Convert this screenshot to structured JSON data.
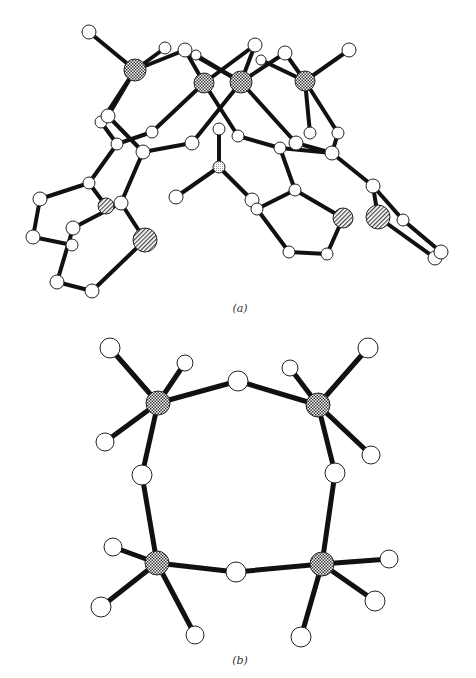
{
  "figure": {
    "width": 476,
    "height": 678,
    "colors": {
      "bond": "#111111",
      "atom_fill": "#ffffff",
      "atom_stroke": "#222222",
      "metal_fill": "#8a8a8a",
      "hetero_fill": "#d8d8d8",
      "caption": "#333333"
    },
    "panels": [
      {
        "id": "a",
        "caption": "(a)",
        "caption_pos": [
          240,
          312
        ],
        "description": "Side view of tetranuclear metal complex with organic ligands",
        "atoms": [
          {
            "id": "a1",
            "x": 89,
            "y": 32,
            "r": 7,
            "type": "light"
          },
          {
            "id": "m1",
            "x": 135,
            "y": 70,
            "r": 11,
            "type": "metal"
          },
          {
            "id": "a2",
            "x": 165,
            "y": 48,
            "r": 6,
            "type": "light"
          },
          {
            "id": "a3",
            "x": 185,
            "y": 50,
            "r": 7,
            "type": "light"
          },
          {
            "id": "a4",
            "x": 196,
            "y": 55,
            "r": 5,
            "type": "light"
          },
          {
            "id": "m2",
            "x": 204,
            "y": 83,
            "r": 10,
            "type": "metal"
          },
          {
            "id": "m3",
            "x": 241,
            "y": 82,
            "r": 11,
            "type": "metal"
          },
          {
            "id": "a5",
            "x": 255,
            "y": 45,
            "r": 7,
            "type": "light"
          },
          {
            "id": "a6",
            "x": 261,
            "y": 60,
            "r": 5,
            "type": "light"
          },
          {
            "id": "a7",
            "x": 285,
            "y": 53,
            "r": 7,
            "type": "light"
          },
          {
            "id": "m4",
            "x": 305,
            "y": 81,
            "r": 10,
            "type": "metal"
          },
          {
            "id": "a8",
            "x": 349,
            "y": 50,
            "r": 7,
            "type": "light"
          },
          {
            "id": "a9",
            "x": 101,
            "y": 122,
            "r": 6,
            "type": "light"
          },
          {
            "id": "a10",
            "x": 108,
            "y": 116,
            "r": 7,
            "type": "light"
          },
          {
            "id": "a11",
            "x": 117,
            "y": 144,
            "r": 6,
            "type": "light"
          },
          {
            "id": "a12",
            "x": 152,
            "y": 132,
            "r": 6,
            "type": "light"
          },
          {
            "id": "a13",
            "x": 143,
            "y": 152,
            "r": 7,
            "type": "light"
          },
          {
            "id": "a14",
            "x": 192,
            "y": 143,
            "r": 7,
            "type": "light"
          },
          {
            "id": "a15",
            "x": 219,
            "y": 129,
            "r": 6,
            "type": "light"
          },
          {
            "id": "a16",
            "x": 238,
            "y": 136,
            "r": 6,
            "type": "light"
          },
          {
            "id": "a17",
            "x": 280,
            "y": 148,
            "r": 6,
            "type": "light"
          },
          {
            "id": "a18",
            "x": 296,
            "y": 143,
            "r": 7,
            "type": "light"
          },
          {
            "id": "a19",
            "x": 310,
            "y": 133,
            "r": 6,
            "type": "light"
          },
          {
            "id": "a20",
            "x": 338,
            "y": 133,
            "r": 6,
            "type": "light"
          },
          {
            "id": "a21",
            "x": 332,
            "y": 153,
            "r": 7,
            "type": "light"
          },
          {
            "id": "a22",
            "x": 219,
            "y": 167,
            "r": 6,
            "type": "hetero"
          },
          {
            "id": "a23",
            "x": 176,
            "y": 197,
            "r": 7,
            "type": "light"
          },
          {
            "id": "a24",
            "x": 89,
            "y": 183,
            "r": 6,
            "type": "light"
          },
          {
            "id": "a25",
            "x": 40,
            "y": 199,
            "r": 7,
            "type": "light"
          },
          {
            "id": "a26",
            "x": 106,
            "y": 206,
            "r": 8,
            "type": "hatched"
          },
          {
            "id": "a27",
            "x": 121,
            "y": 203,
            "r": 7,
            "type": "light"
          },
          {
            "id": "a28",
            "x": 73,
            "y": 228,
            "r": 7,
            "type": "light"
          },
          {
            "id": "a29",
            "x": 33,
            "y": 237,
            "r": 7,
            "type": "light"
          },
          {
            "id": "a30",
            "x": 72,
            "y": 245,
            "r": 6,
            "type": "light"
          },
          {
            "id": "a31",
            "x": 145,
            "y": 240,
            "r": 12,
            "type": "hatched"
          },
          {
            "id": "a32",
            "x": 57,
            "y": 282,
            "r": 7,
            "type": "light"
          },
          {
            "id": "a33",
            "x": 92,
            "y": 291,
            "r": 7,
            "type": "light"
          },
          {
            "id": "a34",
            "x": 295,
            "y": 190,
            "r": 6,
            "type": "light"
          },
          {
            "id": "a35",
            "x": 252,
            "y": 200,
            "r": 7,
            "type": "light"
          },
          {
            "id": "a36",
            "x": 257,
            "y": 209,
            "r": 6,
            "type": "light"
          },
          {
            "id": "a37",
            "x": 343,
            "y": 218,
            "r": 10,
            "type": "hatched"
          },
          {
            "id": "a38",
            "x": 373,
            "y": 186,
            "r": 7,
            "type": "light"
          },
          {
            "id": "a39",
            "x": 378,
            "y": 217,
            "r": 12,
            "type": "hatched"
          },
          {
            "id": "a40",
            "x": 403,
            "y": 220,
            "r": 6,
            "type": "light"
          },
          {
            "id": "a41",
            "x": 289,
            "y": 252,
            "r": 6,
            "type": "light"
          },
          {
            "id": "a42",
            "x": 327,
            "y": 254,
            "r": 6,
            "type": "light"
          },
          {
            "id": "a43",
            "x": 435,
            "y": 258,
            "r": 7,
            "type": "light"
          },
          {
            "id": "a44",
            "x": 441,
            "y": 252,
            "r": 7,
            "type": "light"
          }
        ],
        "bonds": [
          [
            "a1",
            "m1"
          ],
          [
            "m1",
            "a2"
          ],
          [
            "m1",
            "a3"
          ],
          [
            "a3",
            "m2"
          ],
          [
            "a3",
            "m3"
          ],
          [
            "a4",
            "m3"
          ],
          [
            "m2",
            "a5"
          ],
          [
            "m3",
            "a5"
          ],
          [
            "m3",
            "a7"
          ],
          [
            "a7",
            "m4"
          ],
          [
            "a6",
            "m4"
          ],
          [
            "m4",
            "a8"
          ],
          [
            "m1",
            "a10"
          ],
          [
            "m1",
            "a9"
          ],
          [
            "a10",
            "a13"
          ],
          [
            "a9",
            "a11"
          ],
          [
            "m2",
            "a12"
          ],
          [
            "a12",
            "a11"
          ],
          [
            "m3",
            "a14"
          ],
          [
            "a14",
            "a13"
          ],
          [
            "m2",
            "a16"
          ],
          [
            "a16",
            "a17"
          ],
          [
            "m3",
            "a18"
          ],
          [
            "a18",
            "a21"
          ],
          [
            "m4",
            "a19"
          ],
          [
            "m4",
            "a20"
          ],
          [
            "a20",
            "a21"
          ],
          [
            "a17",
            "a21"
          ],
          [
            "a15",
            "a22"
          ],
          [
            "a22",
            "a23"
          ],
          [
            "a22",
            "a35"
          ],
          [
            "a11",
            "a24"
          ],
          [
            "a24",
            "a25"
          ],
          [
            "a25",
            "a29"
          ],
          [
            "a29",
            "a30"
          ],
          [
            "a24",
            "a26"
          ],
          [
            "a13",
            "a27"
          ],
          [
            "a27",
            "a28"
          ],
          [
            "a27",
            "a31"
          ],
          [
            "a28",
            "a32"
          ],
          [
            "a31",
            "a33"
          ],
          [
            "a32",
            "a33"
          ],
          [
            "a17",
            "a34"
          ],
          [
            "a34",
            "a36"
          ],
          [
            "a34",
            "a37"
          ],
          [
            "a36",
            "a41"
          ],
          [
            "a41",
            "a42"
          ],
          [
            "a42",
            "a37"
          ],
          [
            "a21",
            "a38"
          ],
          [
            "a38",
            "a39"
          ],
          [
            "a38",
            "a40"
          ],
          [
            "a39",
            "a43"
          ],
          [
            "a40",
            "a44"
          ],
          [
            "a43",
            "a44"
          ]
        ]
      },
      {
        "id": "b",
        "caption": "(b)",
        "caption_pos": [
          240,
          664
        ],
        "description": "Top view of M4O4 cyclic core with terminal ligands",
        "atoms": [
          {
            "id": "M1",
            "x": 158,
            "y": 403,
            "r": 12,
            "type": "metal"
          },
          {
            "id": "M2",
            "x": 318,
            "y": 405,
            "r": 12,
            "type": "metal"
          },
          {
            "id": "M3",
            "x": 157,
            "y": 563,
            "r": 12,
            "type": "metal"
          },
          {
            "id": "M4",
            "x": 322,
            "y": 564,
            "r": 12,
            "type": "metal"
          },
          {
            "id": "O1",
            "x": 238,
            "y": 381,
            "r": 10,
            "type": "light"
          },
          {
            "id": "O2",
            "x": 142,
            "y": 475,
            "r": 10,
            "type": "light"
          },
          {
            "id": "O3",
            "x": 335,
            "y": 473,
            "r": 10,
            "type": "light"
          },
          {
            "id": "O4",
            "x": 236,
            "y": 572,
            "r": 10,
            "type": "light"
          },
          {
            "id": "T1",
            "x": 110,
            "y": 348,
            "r": 10,
            "type": "light"
          },
          {
            "id": "T2",
            "x": 185,
            "y": 363,
            "r": 8,
            "type": "light"
          },
          {
            "id": "T3",
            "x": 105,
            "y": 442,
            "r": 9,
            "type": "light"
          },
          {
            "id": "T4",
            "x": 290,
            "y": 368,
            "r": 8,
            "type": "light"
          },
          {
            "id": "T5",
            "x": 368,
            "y": 348,
            "r": 10,
            "type": "light"
          },
          {
            "id": "T6",
            "x": 371,
            "y": 455,
            "r": 9,
            "type": "light"
          },
          {
            "id": "T7",
            "x": 113,
            "y": 547,
            "r": 9,
            "type": "light"
          },
          {
            "id": "T8",
            "x": 101,
            "y": 607,
            "r": 10,
            "type": "light"
          },
          {
            "id": "T9",
            "x": 195,
            "y": 635,
            "r": 9,
            "type": "light"
          },
          {
            "id": "T10",
            "x": 389,
            "y": 559,
            "r": 9,
            "type": "light"
          },
          {
            "id": "T11",
            "x": 375,
            "y": 601,
            "r": 10,
            "type": "light"
          },
          {
            "id": "T12",
            "x": 301,
            "y": 637,
            "r": 10,
            "type": "light"
          }
        ],
        "bonds": [
          [
            "M1",
            "O1"
          ],
          [
            "O1",
            "M2"
          ],
          [
            "M1",
            "O2"
          ],
          [
            "O2",
            "M3"
          ],
          [
            "M2",
            "O3"
          ],
          [
            "O3",
            "M4"
          ],
          [
            "M3",
            "O4"
          ],
          [
            "O4",
            "M4"
          ],
          [
            "M1",
            "T1"
          ],
          [
            "M1",
            "T2"
          ],
          [
            "M1",
            "T3"
          ],
          [
            "M2",
            "T4"
          ],
          [
            "M2",
            "T5"
          ],
          [
            "M2",
            "T6"
          ],
          [
            "M3",
            "T7"
          ],
          [
            "M3",
            "T8"
          ],
          [
            "M3",
            "T9"
          ],
          [
            "M4",
            "T10"
          ],
          [
            "M4",
            "T11"
          ],
          [
            "M4",
            "T12"
          ]
        ]
      }
    ]
  }
}
